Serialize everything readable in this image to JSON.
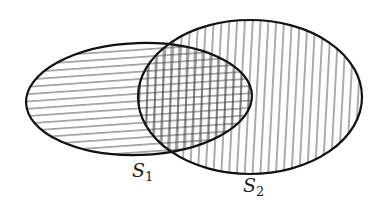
{
  "diagram": {
    "type": "venn",
    "width": 383,
    "height": 206,
    "background": "#ffffff",
    "stroke_color": "#111111",
    "hatch_color": "#444444",
    "sets": [
      {
        "id": "S1",
        "label_main": "S",
        "label_sub": "1",
        "hatch": "horizontal",
        "ellipse": {
          "cx": 139,
          "cy": 99,
          "rx": 113,
          "ry": 56,
          "rotate": -2
        },
        "label_pos": {
          "x": 132,
          "y": 177
        }
      },
      {
        "id": "S2",
        "label_main": "S",
        "label_sub": "2",
        "hatch": "vertical",
        "ellipse": {
          "cx": 250,
          "cy": 97,
          "rx": 112,
          "ry": 77,
          "rotate": 0
        },
        "label_pos": {
          "x": 243,
          "y": 192
        }
      }
    ],
    "intersection": {
      "hatch": "crosshatch",
      "description": "S1 ∩ S2 shaded with both horizontal and vertical lines"
    },
    "hatch_spacing": {
      "horizontal": 7.3,
      "vertical": 7.8
    }
  }
}
